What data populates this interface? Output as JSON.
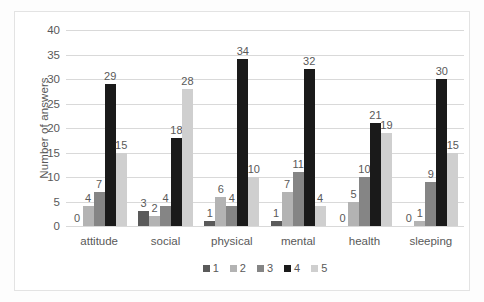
{
  "chart_data": {
    "type": "bar",
    "title": "",
    "xlabel": "",
    "ylabel": "Number of answers",
    "ylim": [
      0,
      40
    ],
    "ytick_step": 5,
    "yticks": [
      40,
      35,
      30,
      25,
      20,
      15,
      10,
      5,
      0
    ],
    "grid": true,
    "legend_position": "bottom",
    "categories": [
      "attitude",
      "social",
      "physical",
      "mental",
      "health",
      "sleeping"
    ],
    "series": [
      {
        "name": "1",
        "color": "#5a5a5a",
        "values": [
          0,
          3,
          1,
          1,
          0,
          0
        ]
      },
      {
        "name": "2",
        "color": "#b3b3b3",
        "values": [
          4,
          2,
          6,
          7,
          5,
          1
        ]
      },
      {
        "name": "3",
        "color": "#858585",
        "values": [
          7,
          4,
          4,
          11,
          10,
          9
        ]
      },
      {
        "name": "4",
        "color": "#1a1a1a",
        "values": [
          29,
          18,
          34,
          32,
          21,
          30
        ]
      },
      {
        "name": "5",
        "color": "#cfcfcf",
        "values": [
          15,
          28,
          10,
          4,
          19,
          15
        ]
      }
    ],
    "bar_labels": [
      [
        "0",
        "4",
        "7",
        "29",
        "15"
      ],
      [
        "3",
        "2",
        "4",
        "18",
        "28"
      ],
      [
        "1",
        "6",
        "4",
        "34",
        "10"
      ],
      [
        "1",
        "7",
        "11",
        "32",
        "4"
      ],
      [
        "0",
        "5",
        "10",
        "21",
        "19"
      ],
      [
        "0",
        "1",
        "9",
        "30",
        "15"
      ]
    ]
  },
  "legend": {
    "items": [
      {
        "label": "1",
        "color": "#5a5a5a"
      },
      {
        "label": "2",
        "color": "#b3b3b3"
      },
      {
        "label": "3",
        "color": "#858585"
      },
      {
        "label": "4",
        "color": "#1a1a1a"
      },
      {
        "label": "5",
        "color": "#cfcfcf"
      }
    ]
  }
}
